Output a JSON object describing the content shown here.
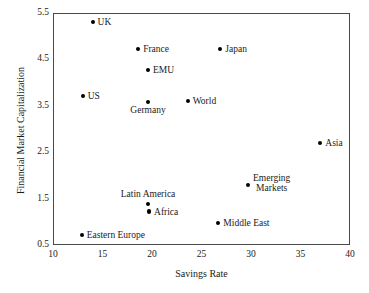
{
  "chart_data": {
    "type": "scatter",
    "title": "",
    "xlabel": "Savings Rate",
    "ylabel": "Financial Market Capitalization",
    "xlim": [
      10,
      40
    ],
    "ylim": [
      0.5,
      5.5
    ],
    "xticks": [
      "10",
      "15",
      "20",
      "25",
      "30",
      "35",
      "40"
    ],
    "yticks": [
      "0.5",
      "1.5",
      "2.5",
      "3.5",
      "4.5",
      "5.5"
    ],
    "grid": false,
    "legend": "none",
    "marker_color": "#000000",
    "frame_color": "#4a4a4a",
    "points": [
      {
        "label": "UK",
        "x": 14.0,
        "y": 5.31,
        "pos": "right"
      },
      {
        "label": "France",
        "x": 18.6,
        "y": 4.73,
        "pos": "right"
      },
      {
        "label": "Japan",
        "x": 26.9,
        "y": 4.73,
        "pos": "right"
      },
      {
        "label": "EMU",
        "x": 19.6,
        "y": 4.27,
        "pos": "right"
      },
      {
        "label": "US",
        "x": 13.0,
        "y": 3.71,
        "pos": "right"
      },
      {
        "label": "Germany",
        "x": 19.6,
        "y": 3.59,
        "pos": "below"
      },
      {
        "label": "World",
        "x": 23.6,
        "y": 3.61,
        "pos": "right"
      },
      {
        "label": "Asia",
        "x": 37.0,
        "y": 2.7,
        "pos": "right"
      },
      {
        "label": "Emerging\nMarkets",
        "x": 29.7,
        "y": 1.8,
        "pos": "right2"
      },
      {
        "label": "Latin America",
        "x": 19.6,
        "y": 1.39,
        "pos": "above"
      },
      {
        "label": "Africa",
        "x": 19.7,
        "y": 1.22,
        "pos": "right"
      },
      {
        "label": "Middle East",
        "x": 26.7,
        "y": 0.98,
        "pos": "right"
      },
      {
        "label": "Eastern Europe",
        "x": 12.9,
        "y": 0.72,
        "pos": "right"
      }
    ]
  }
}
